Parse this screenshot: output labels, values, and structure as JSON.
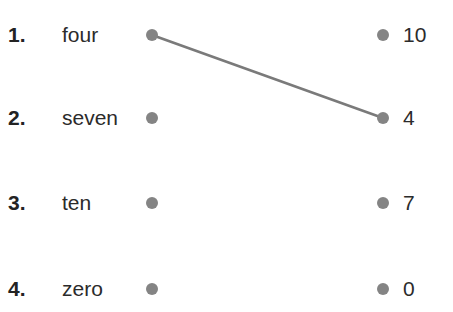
{
  "exercise": {
    "title": "matching-exercise",
    "dot_color": "#848484",
    "line_color": "#7a7a7a",
    "text_color": "#2b2b2b",
    "rows": [
      {
        "index": "1.",
        "word": "four",
        "value": "10"
      },
      {
        "index": "2.",
        "word": "seven",
        "value": "4"
      },
      {
        "index": "3.",
        "word": "ten",
        "value": "7"
      },
      {
        "index": "4.",
        "word": "zero",
        "value": "0"
      }
    ],
    "connections": [
      {
        "from_row": 1,
        "to_row": 2,
        "from_x": 152,
        "from_y": 35,
        "to_x": 383,
        "to_y": 118
      }
    ]
  }
}
